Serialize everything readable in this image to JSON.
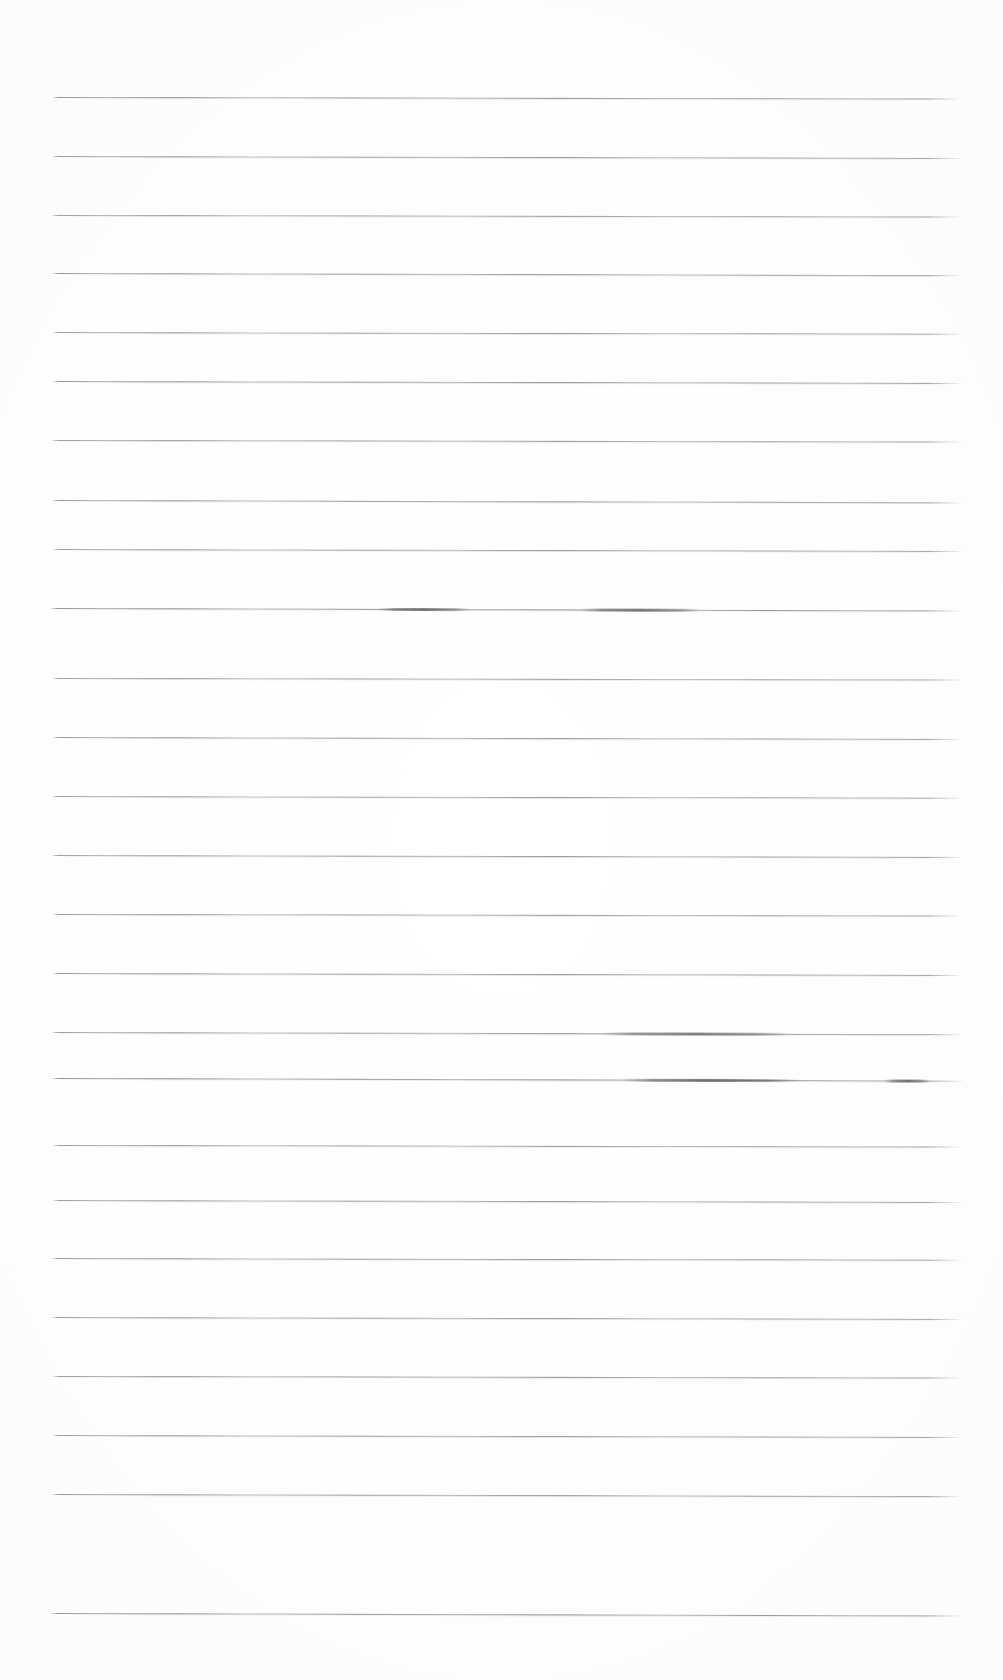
{
  "document": {
    "kind": "scanned-ruled-notebook-page",
    "title": "",
    "visible_text": "",
    "background_color": "#ffffff",
    "ink_color": "#5e5e64",
    "page_width": 1003,
    "page_height": 1680
  },
  "ruling": {
    "line_count": 26,
    "first_line_y": 97,
    "line_spacing": 60,
    "left_margin_x": 52,
    "right_margin_x": 965,
    "stroke_thickness": 1,
    "slope_note": "lines tilt very slightly downward to the right"
  },
  "lines": [
    {
      "index": 1,
      "y": 97,
      "x1": 52,
      "x2": 962,
      "tilt": 0.1,
      "opacity": 0.82
    },
    {
      "index": 2,
      "y": 156,
      "x1": 52,
      "x2": 963,
      "tilt": 0.12,
      "opacity": 0.8
    },
    {
      "index": 3,
      "y": 215,
      "x1": 51,
      "x2": 963,
      "tilt": 0.1,
      "opacity": 0.78
    },
    {
      "index": 4,
      "y": 273,
      "x1": 51,
      "x2": 964,
      "tilt": 0.14,
      "opacity": 0.8
    },
    {
      "index": 5,
      "y": 332,
      "x1": 52,
      "x2": 964,
      "tilt": 0.11,
      "opacity": 0.79
    },
    {
      "index": 6,
      "y": 381,
      "x1": 52,
      "x2": 963,
      "tilt": 0.13,
      "opacity": 0.83
    },
    {
      "index": 7,
      "y": 440,
      "x1": 51,
      "x2": 963,
      "tilt": 0.1,
      "opacity": 0.78
    },
    {
      "index": 8,
      "y": 500,
      "x1": 51,
      "x2": 964,
      "tilt": 0.15,
      "opacity": 0.81
    },
    {
      "index": 9,
      "y": 549,
      "x1": 52,
      "x2": 964,
      "tilt": 0.12,
      "opacity": 0.79
    },
    {
      "index": 10,
      "y": 608,
      "x1": 50,
      "x2": 962,
      "tilt": 0.16,
      "opacity": 0.86,
      "smudges": [
        {
          "x1": 378,
          "x2": 470
        },
        {
          "x1": 580,
          "x2": 700
        }
      ]
    },
    {
      "index": 11,
      "y": 678,
      "x1": 52,
      "x2": 963,
      "tilt": 0.1,
      "opacity": 0.78
    },
    {
      "index": 12,
      "y": 737,
      "x1": 52,
      "x2": 963,
      "tilt": 0.12,
      "opacity": 0.8
    },
    {
      "index": 13,
      "y": 796,
      "x1": 51,
      "x2": 964,
      "tilt": 0.11,
      "opacity": 0.77
    },
    {
      "index": 14,
      "y": 855,
      "x1": 51,
      "x2": 964,
      "tilt": 0.13,
      "opacity": 0.8
    },
    {
      "index": 15,
      "y": 914,
      "x1": 52,
      "x2": 963,
      "tilt": 0.1,
      "opacity": 0.79
    },
    {
      "index": 16,
      "y": 973,
      "x1": 52,
      "x2": 963,
      "tilt": 0.12,
      "opacity": 0.81
    },
    {
      "index": 17,
      "y": 1032,
      "x1": 51,
      "x2": 964,
      "tilt": 0.14,
      "opacity": 0.8,
      "smudges": [
        {
          "x1": 600,
          "x2": 790
        }
      ]
    },
    {
      "index": 18,
      "y": 1078,
      "x1": 51,
      "x2": 965,
      "tilt": 0.17,
      "opacity": 0.87,
      "smudges": [
        {
          "x1": 620,
          "x2": 800
        },
        {
          "x1": 885,
          "x2": 930
        }
      ]
    },
    {
      "index": 19,
      "y": 1145,
      "x1": 52,
      "x2": 963,
      "tilt": 0.1,
      "opacity": 0.78
    },
    {
      "index": 20,
      "y": 1200,
      "x1": 52,
      "x2": 963,
      "tilt": 0.12,
      "opacity": 0.79
    },
    {
      "index": 21,
      "y": 1258,
      "x1": 51,
      "x2": 964,
      "tilt": 0.11,
      "opacity": 0.8
    },
    {
      "index": 22,
      "y": 1317,
      "x1": 51,
      "x2": 964,
      "tilt": 0.13,
      "opacity": 0.78
    },
    {
      "index": 23,
      "y": 1376,
      "x1": 52,
      "x2": 963,
      "tilt": 0.1,
      "opacity": 0.8
    },
    {
      "index": 24,
      "y": 1435,
      "x1": 52,
      "x2": 963,
      "tilt": 0.12,
      "opacity": 0.79
    },
    {
      "index": 25,
      "y": 1494,
      "x1": 51,
      "x2": 964,
      "tilt": 0.14,
      "opacity": 0.81
    },
    {
      "index": 26,
      "y": 1613,
      "x1": 50,
      "x2": 962,
      "tilt": 0.16,
      "opacity": 0.84
    }
  ]
}
